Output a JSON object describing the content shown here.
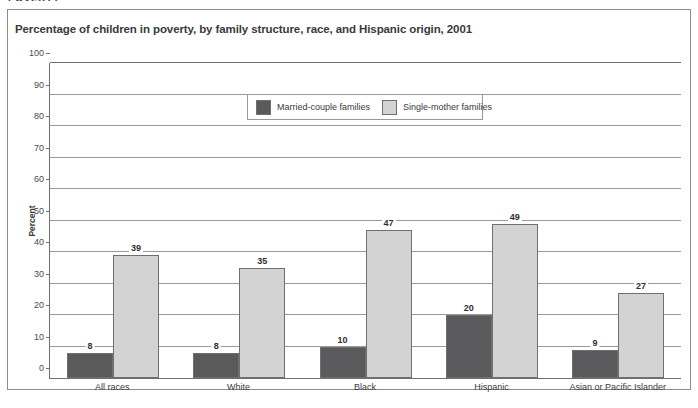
{
  "page": {
    "cut_off_heading": "POVERTY"
  },
  "figure": {
    "title": "Percentage of children in poverty, by family structure, race, and Hispanic origin, 2001"
  },
  "legend": {
    "items": [
      {
        "label": "Married-couple families",
        "color": "#5a5a5c",
        "swatch_name": "legend-swatch-married-couple"
      },
      {
        "label": "Single-mother families",
        "color": "#d3d3d3",
        "swatch_name": "legend-swatch-single-mother"
      }
    ]
  },
  "chart_data": {
    "type": "bar",
    "title": "Percentage of children in poverty, by family structure, race, and Hispanic origin, 2001",
    "xlabel": "",
    "ylabel": "Percent",
    "ylim": [
      0,
      100
    ],
    "yticks": [
      0,
      10,
      20,
      30,
      40,
      50,
      60,
      70,
      80,
      90,
      100
    ],
    "grid": true,
    "legend_position": "top-center",
    "categories": [
      "All races",
      "White",
      "Black",
      "Hispanic",
      "Asian or Pacific Islander"
    ],
    "series": [
      {
        "name": "Married-couple families",
        "color": "#5a5a5c",
        "values": [
          8,
          8,
          10,
          20,
          9
        ]
      },
      {
        "name": "Single-mother families",
        "color": "#d3d3d3",
        "values": [
          39,
          35,
          47,
          49,
          27
        ]
      }
    ]
  }
}
